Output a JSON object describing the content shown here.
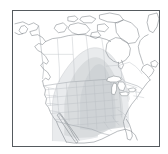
{
  "figure": {
    "kind": "map-thumbnail",
    "region": "North America",
    "background_color": "#ffffff",
    "frame_color": "#555a5e",
    "frame_width_px": 1,
    "coastline_color": "#7d8287",
    "border_color": "#9aa0a5",
    "subdivision_color": "#b9bec3",
    "shading_color": "#d7dadc",
    "shading_color_light": "#e8eaec",
    "shading_label": "central-plains-shaded-region",
    "frame": {
      "left": 12,
      "top": 10,
      "width": 148,
      "height": 137
    },
    "canvas": {
      "width": 168,
      "height": 154
    }
  },
  "layers": [
    {
      "id": "ocean",
      "label": "Ocean",
      "color": "#ffffff"
    },
    {
      "id": "landmass",
      "label": "Landmass",
      "color": "#ffffff"
    },
    {
      "id": "country-borders",
      "label": "Country borders",
      "color": "#9aa0a5"
    },
    {
      "id": "state-province-borders",
      "label": "State and province borders",
      "color": "#b9bec3"
    },
    {
      "id": "shaded-overlay",
      "label": "Shaded overlay",
      "color": "#d7dadc"
    }
  ],
  "features": [
    {
      "id": "alaska",
      "label": "Alaska"
    },
    {
      "id": "canada",
      "label": "Canada"
    },
    {
      "id": "arctic-islands",
      "label": "Canadian Arctic Archipelago"
    },
    {
      "id": "hudson-bay",
      "label": "Hudson Bay"
    },
    {
      "id": "greenland-edge",
      "label": "Greenland"
    },
    {
      "id": "united-states",
      "label": "United States"
    },
    {
      "id": "great-lakes",
      "label": "Great Lakes"
    },
    {
      "id": "florida",
      "label": "Florida"
    },
    {
      "id": "baja-california",
      "label": "Baja California"
    },
    {
      "id": "mexico",
      "label": "Mexico"
    },
    {
      "id": "great-plains-shading",
      "label": "Great Plains shaded area"
    }
  ]
}
